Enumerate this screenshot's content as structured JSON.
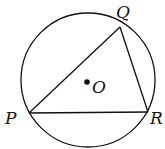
{
  "diagram": {
    "type": "circle-inscribed-triangle",
    "circle": {
      "cx": 88,
      "cy": 80,
      "r": 67
    },
    "points": {
      "P": {
        "label": "P",
        "x": 29,
        "y": 113,
        "lx": 5,
        "ly": 124
      },
      "Q": {
        "label": "Q",
        "x": 120,
        "y": 27,
        "lx": 116,
        "ly": 18
      },
      "R": {
        "label": "R",
        "x": 148,
        "y": 112,
        "lx": 150,
        "ly": 124
      },
      "O": {
        "label": "O",
        "x": 87,
        "y": 82,
        "lx": 92,
        "ly": 93
      }
    },
    "stroke_color": "#111111"
  }
}
